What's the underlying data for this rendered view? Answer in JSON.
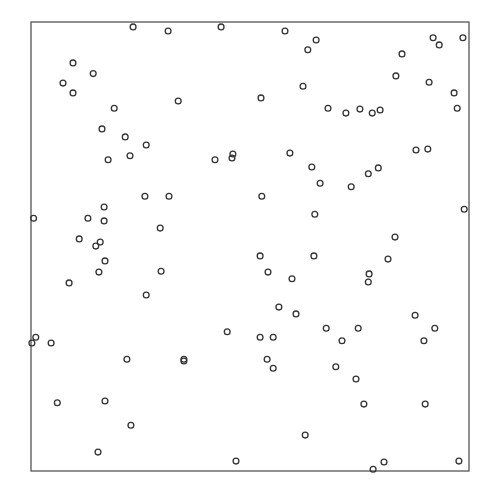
{
  "chart_data": {
    "type": "scatter",
    "title": "",
    "xlabel": "",
    "ylabel": "",
    "xlim": [
      0,
      1
    ],
    "ylim": [
      0,
      1
    ],
    "grid": false,
    "legend": null,
    "marker": "open-circle",
    "marker_color": "#333333",
    "frame_color": "#555555",
    "series": [
      {
        "name": "points",
        "points": [
          [
            0.233,
            0.989
          ],
          [
            0.313,
            0.98
          ],
          [
            0.434,
            0.989
          ],
          [
            0.58,
            0.98
          ],
          [
            0.651,
            0.96
          ],
          [
            0.632,
            0.938
          ],
          [
            0.918,
            0.965
          ],
          [
            0.932,
            0.949
          ],
          [
            0.986,
            0.965
          ],
          [
            0.847,
            0.929
          ],
          [
            0.833,
            0.88
          ],
          [
            0.909,
            0.866
          ],
          [
            0.096,
            0.909
          ],
          [
            0.142,
            0.885
          ],
          [
            0.073,
            0.864
          ],
          [
            0.096,
            0.842
          ],
          [
            0.621,
            0.857
          ],
          [
            0.966,
            0.842
          ],
          [
            0.336,
            0.824
          ],
          [
            0.525,
            0.831
          ],
          [
            0.973,
            0.808
          ],
          [
            0.19,
            0.808
          ],
          [
            0.678,
            0.808
          ],
          [
            0.719,
            0.797
          ],
          [
            0.751,
            0.806
          ],
          [
            0.779,
            0.797
          ],
          [
            0.797,
            0.804
          ],
          [
            0.162,
            0.762
          ],
          [
            0.215,
            0.744
          ],
          [
            0.263,
            0.726
          ],
          [
            0.226,
            0.702
          ],
          [
            0.176,
            0.693
          ],
          [
            0.42,
            0.693
          ],
          [
            0.461,
            0.706
          ],
          [
            0.459,
            0.697
          ],
          [
            0.591,
            0.708
          ],
          [
            0.879,
            0.715
          ],
          [
            0.906,
            0.717
          ],
          [
            0.641,
            0.677
          ],
          [
            0.66,
            0.641
          ],
          [
            0.77,
            0.662
          ],
          [
            0.793,
            0.675
          ],
          [
            0.731,
            0.633
          ],
          [
            0.26,
            0.612
          ],
          [
            0.315,
            0.612
          ],
          [
            0.527,
            0.612
          ],
          [
            0.167,
            0.588
          ],
          [
            0.006,
            0.563
          ],
          [
            0.13,
            0.563
          ],
          [
            0.167,
            0.557
          ],
          [
            0.648,
            0.572
          ],
          [
            0.989,
            0.583
          ],
          [
            0.295,
            0.541
          ],
          [
            0.11,
            0.517
          ],
          [
            0.158,
            0.51
          ],
          [
            0.148,
            0.501
          ],
          [
            0.831,
            0.521
          ],
          [
            0.169,
            0.468
          ],
          [
            0.523,
            0.479
          ],
          [
            0.646,
            0.479
          ],
          [
            0.815,
            0.472
          ],
          [
            0.155,
            0.443
          ],
          [
            0.297,
            0.445
          ],
          [
            0.541,
            0.443
          ],
          [
            0.596,
            0.428
          ],
          [
            0.772,
            0.439
          ],
          [
            0.77,
            0.421
          ],
          [
            0.087,
            0.419
          ],
          [
            0.263,
            0.392
          ],
          [
            0.566,
            0.365
          ],
          [
            0.605,
            0.35
          ],
          [
            0.877,
            0.347
          ],
          [
            0.674,
            0.318
          ],
          [
            0.747,
            0.318
          ],
          [
            0.922,
            0.318
          ],
          [
            0.448,
            0.31
          ],
          [
            0.523,
            0.298
          ],
          [
            0.553,
            0.298
          ],
          [
            0.71,
            0.29
          ],
          [
            0.897,
            0.29
          ],
          [
            0.011,
            0.298
          ],
          [
            0.002,
            0.285
          ],
          [
            0.046,
            0.285
          ],
          [
            0.349,
            0.245
          ],
          [
            0.349,
            0.249
          ],
          [
            0.539,
            0.249
          ],
          [
            0.553,
            0.229
          ],
          [
            0.696,
            0.232
          ],
          [
            0.742,
            0.205
          ],
          [
            0.219,
            0.249
          ],
          [
            0.06,
            0.152
          ],
          [
            0.169,
            0.156
          ],
          [
            0.76,
            0.149
          ],
          [
            0.9,
            0.149
          ],
          [
            0.228,
            0.102
          ],
          [
            0.626,
            0.08
          ],
          [
            0.153,
            0.042
          ],
          [
            0.468,
            0.022
          ],
          [
            0.806,
            0.02
          ],
          [
            0.781,
            0.004
          ],
          [
            0.977,
            0.022
          ]
        ]
      }
    ]
  },
  "plot_frame": {
    "left_px": 31,
    "top_px": 22,
    "width_px": 438,
    "height_px": 449
  }
}
